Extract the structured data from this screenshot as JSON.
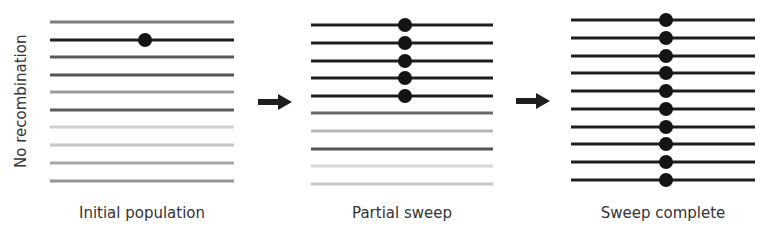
{
  "figure": {
    "y_axis_label": "No recombination",
    "panels": [
      {
        "title": "Initial population",
        "x1": 50,
        "x2": 234,
        "rows_y": [
          22,
          40,
          57,
          75,
          92,
          110,
          127,
          145,
          163,
          181
        ],
        "row_colors": [
          "#7d7d7d",
          "#1e1e1e",
          "#5a5a5a",
          "#555555",
          "#9a9a9a",
          "#5c5c5c",
          "#d2d2d2",
          "#c4c4c4",
          "#a8a8a8",
          "#959595"
        ],
        "dot_rows": [
          1
        ],
        "dot_x": 145
      },
      {
        "title": "Partial sweep",
        "x1": 311,
        "x2": 493,
        "rows_y": [
          25,
          43,
          61,
          78,
          96,
          113,
          131,
          149,
          166,
          184
        ],
        "row_colors": [
          "#1e1e1e",
          "#1e1e1e",
          "#1e1e1e",
          "#1e1e1e",
          "#1e1e1e",
          "#6a6a6a",
          "#b6b6b6",
          "#555555",
          "#d8d8d8",
          "#c6c6c6"
        ],
        "dot_rows": [
          0,
          1,
          2,
          3,
          4
        ],
        "dot_x": 405
      },
      {
        "title": "Sweep complete",
        "x1": 571,
        "x2": 755,
        "rows_y": [
          20,
          38,
          56,
          73,
          91,
          109,
          127,
          144,
          162,
          180
        ],
        "row_colors": [
          "#1e1e1e",
          "#1e1e1e",
          "#1e1e1e",
          "#1e1e1e",
          "#1e1e1e",
          "#1e1e1e",
          "#1e1e1e",
          "#1e1e1e",
          "#1e1e1e",
          "#1e1e1e"
        ],
        "dot_rows": [
          0,
          1,
          2,
          3,
          4,
          5,
          6,
          7,
          8,
          9
        ],
        "dot_x": 666
      }
    ],
    "arrows": [
      {
        "x1": 258,
        "x2": 292,
        "y": 102
      },
      {
        "x1": 516,
        "x2": 550,
        "y": 101
      }
    ],
    "colors": {
      "dot": "#141414",
      "arrow": "#1e1e1e",
      "text": "#333333"
    }
  }
}
